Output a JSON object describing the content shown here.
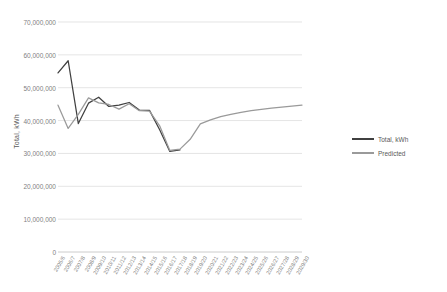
{
  "chart_data": {
    "type": "line",
    "title": "",
    "xlabel": "",
    "ylabel": "Total, kWh",
    "ylim": [
      0,
      70000000
    ],
    "ytick_step": 10000000,
    "grid": true,
    "legend_position": "right",
    "categories": [
      "2005/6",
      "2006/7",
      "2007/8",
      "2008/9",
      "2009/10",
      "2010/11",
      "2011/12",
      "2012/13",
      "2013/14",
      "2014/15",
      "2015/16",
      "2016/17",
      "2017/18",
      "2018/19",
      "2019/20",
      "2020/21",
      "2021/22",
      "2022/23",
      "2023/24",
      "2024/25",
      "2025/26",
      "2026/27",
      "2027/28",
      "2028/29",
      "2029/30"
    ],
    "ytick_labels": [
      "70,000,000",
      "60,000,000",
      "50,000,000",
      "40,000,000",
      "30,000,000",
      "20,000,000",
      "10,000,000",
      "0"
    ],
    "series": [
      {
        "name": "Total, kWh",
        "color": "#404040",
        "values": [
          54500000,
          58200000,
          39100000,
          45300000,
          47100000,
          44300000,
          44700000,
          45500000,
          43200000,
          43100000,
          37200000,
          30600000,
          31100000,
          null,
          null,
          null,
          null,
          null,
          null,
          null,
          null,
          null,
          null,
          null,
          null
        ]
      },
      {
        "name": "Predicted",
        "color": "#9a9a9a",
        "values": [
          44700000,
          37600000,
          41900000,
          46900000,
          45400000,
          44900000,
          43500000,
          45100000,
          43000000,
          42900000,
          38400000,
          30900000,
          31300000,
          34300000,
          39000000,
          40200000,
          41200000,
          41900000,
          42500000,
          43000000,
          43400000,
          43800000,
          44100000,
          44400000,
          44700000
        ]
      }
    ]
  },
  "legend": {
    "items": [
      {
        "label": "Total, kWh"
      },
      {
        "label": "Predicted"
      }
    ]
  }
}
